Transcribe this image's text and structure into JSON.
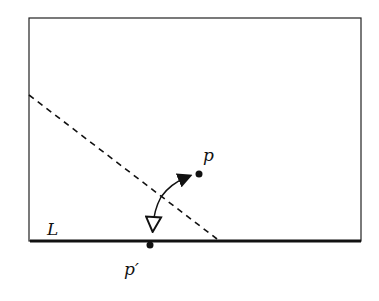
{
  "diagram": {
    "labels": {
      "line": "L",
      "point": "p",
      "image_point": "p′"
    },
    "colors": {
      "stroke": "#111111",
      "background": "#ffffff"
    }
  }
}
